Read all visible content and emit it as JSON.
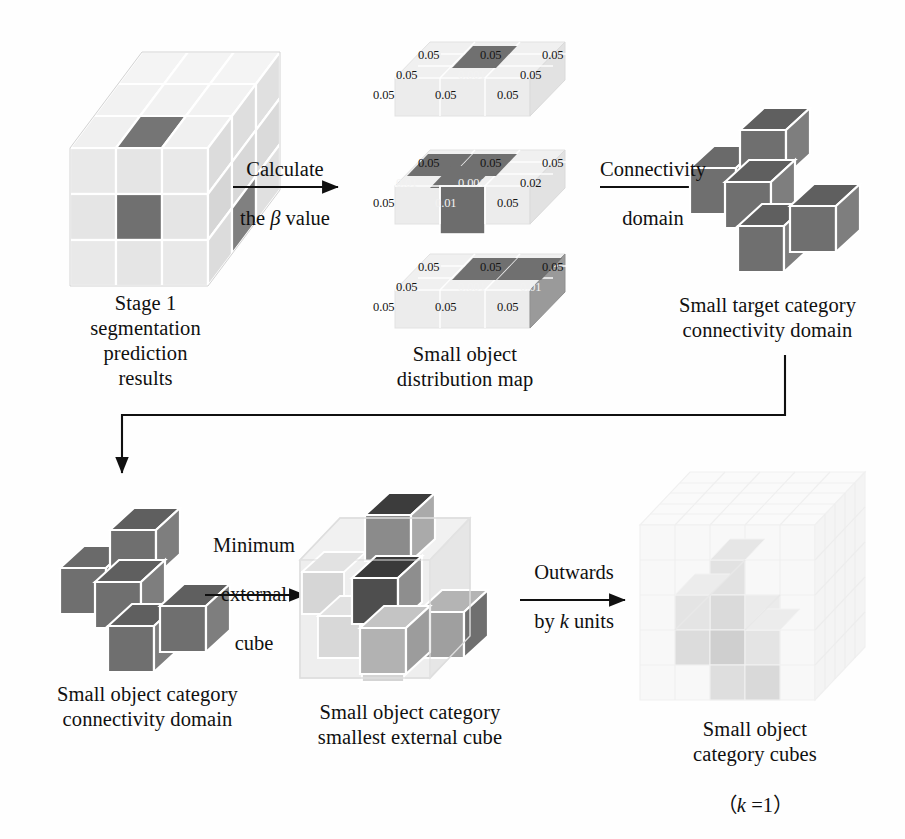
{
  "figure": {
    "background": "#ffffff"
  },
  "palette": {
    "dark_cube": "#6e6e6e",
    "dark_cube_top": "#5d5d5d",
    "dark_cube_side": "#7d7d7d",
    "darkest_cube": "#4a4a4a",
    "light_cube": "#e6e6e6",
    "light_cube_top": "#efefef",
    "light_cube_side": "#d8d8d8",
    "faint_cube": "#f3f3f3",
    "ink": "#141414",
    "edge": "#ffffff"
  },
  "stages": {
    "stage1": {
      "caption": "Stage 1\nsegmentation\nprediction\nresults",
      "name": "stage-1-prediction-cube"
    },
    "distribution": {
      "caption": "Small object\ndistribution map",
      "name": "small-object-distribution-map"
    },
    "connectivity": {
      "caption": "Small target category\nconnectivity domain",
      "name": "small-target-connectivity-domain"
    },
    "object_connectivity": {
      "caption": "Small object category\nconnectivity domain",
      "name": "small-object-connectivity-domain"
    },
    "external_cube": {
      "caption": "Small object category\nsmallest external cube",
      "name": "small-object-smallest-external-cube"
    },
    "cubes": {
      "caption": "Small object\ncategory cubes",
      "sub_caption": "（k =1）",
      "k_prefix": "（",
      "k_symbol": "k",
      "k_value": " =1",
      "k_suffix": "）",
      "name": "small-object-category-cubes"
    }
  },
  "arrows": {
    "a1": {
      "label": "Calculate\nthe β value",
      "line1": "Calculate",
      "line2_pre": "the ",
      "line2_sym": "β",
      "line2_post": " value"
    },
    "a2": {
      "label": "Connectivity\ndomain",
      "line1": "Connectivity",
      "line2": "domain"
    },
    "a3": {
      "label": "Minimum\nexternal\ncube",
      "line1": "Minimum",
      "line2": "external",
      "line3": "cube"
    },
    "a4": {
      "label": "Outwards\nby k units",
      "line1": "Outwards",
      "line2_pre": "by ",
      "line2_sym": "k",
      "line2_post": " units"
    }
  },
  "distribution_slabs": [
    {
      "name": "slab-top",
      "rows": [
        {
          "cells": [
            {
              "text": "0.05",
              "highlight": false
            },
            {
              "text": "0.05",
              "highlight": false
            },
            {
              "text": "0.05",
              "highlight": false
            }
          ]
        },
        {
          "cells": [
            {
              "text": "0.05",
              "highlight": false
            },
            {
              "text": "0.001",
              "highlight": true
            },
            {
              "text": "0.05",
              "highlight": false
            }
          ]
        },
        {
          "cells": [
            {
              "text": "0.05",
              "highlight": false
            },
            {
              "text": "0.05",
              "highlight": false
            },
            {
              "text": "0.05",
              "highlight": false
            }
          ]
        }
      ]
    },
    {
      "name": "slab-middle",
      "rows": [
        {
          "cells": [
            {
              "text": "0.05",
              "highlight": false
            },
            {
              "text": "0.05",
              "highlight": false
            },
            {
              "text": "0.05",
              "highlight": false
            }
          ]
        },
        {
          "cells": [
            {
              "text": "0.01",
              "highlight": true
            },
            {
              "text": "0.001",
              "highlight": true
            },
            {
              "text": "0.02",
              "highlight": false
            }
          ]
        },
        {
          "cells": [
            {
              "text": "0.05",
              "highlight": false
            },
            {
              "text": "0.01",
              "highlight": true
            },
            {
              "text": "0.05",
              "highlight": false
            }
          ]
        }
      ]
    },
    {
      "name": "slab-bottom",
      "rows": [
        {
          "cells": [
            {
              "text": "0.05",
              "highlight": false
            },
            {
              "text": "0.05",
              "highlight": false
            },
            {
              "text": "0.05",
              "highlight": false
            }
          ]
        },
        {
          "cells": [
            {
              "text": "0.05",
              "highlight": false
            },
            {
              "text": "0.001",
              "highlight": true
            },
            {
              "text": "0.01",
              "highlight": true
            }
          ]
        },
        {
          "cells": [
            {
              "text": "0.05",
              "highlight": false
            },
            {
              "text": "0.05",
              "highlight": false
            },
            {
              "text": "0.05",
              "highlight": false
            }
          ]
        }
      ]
    }
  ]
}
